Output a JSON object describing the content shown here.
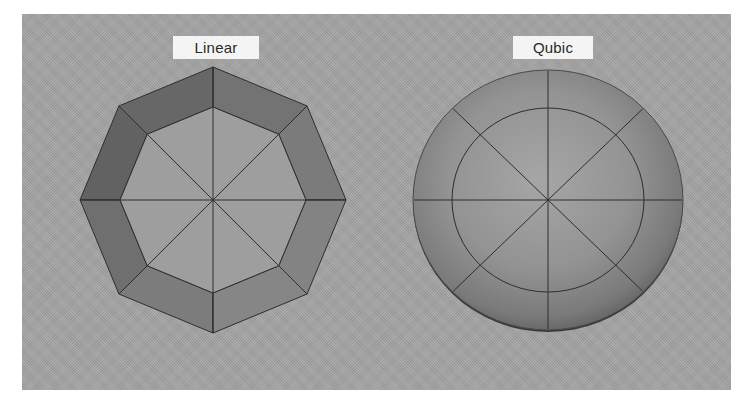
{
  "panel": {
    "background": "#a6a6a6"
  },
  "figures": [
    {
      "id": "linear",
      "label": "Linear",
      "shape": "octagon",
      "center": [
        213,
        200
      ],
      "outer_radius": 133,
      "inner_radius": 93,
      "inner_fill": "#9e9e9e",
      "band_fills": [
        "#7b7b7b",
        "#737373",
        "#676767",
        "#626262",
        "#6f6f6f",
        "#7c7c7c",
        "#868686",
        "#838383"
      ],
      "radial_spokes": 8
    },
    {
      "id": "qubic",
      "label": "Qubic",
      "shape": "sphere",
      "center": [
        548,
        200
      ],
      "outer_radius": [
        135,
        130
      ],
      "inner_radius": [
        96,
        92
      ],
      "gradient": [
        "#a4a4a4",
        "#8c8c8c",
        "#666666"
      ],
      "radial_spokes": 8
    }
  ],
  "colors": {
    "line": "#2e2e2e",
    "label_bg": "#f4f4f4",
    "label_text": "#2a2a2a"
  }
}
